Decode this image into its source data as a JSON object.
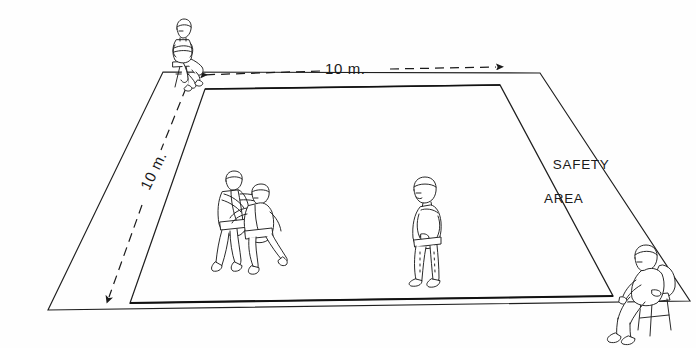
{
  "figure": {
    "type": "technical-line-drawing",
    "background_color": "#ffffff",
    "line_color": "#1a1a1a"
  },
  "labels": {
    "dimension_horizontal": "10 m.",
    "dimension_vertical": "10 m.",
    "safety_area_line1": "SAFETY",
    "safety_area_line2": "AREA"
  },
  "areas": [
    {
      "name": "contest-area",
      "label": "contest area",
      "size": "10 m. x 10 m."
    },
    {
      "name": "safety-area",
      "label": "SAFETY AREA"
    }
  ],
  "dimensions": [
    {
      "name": "width",
      "value": "10 m.",
      "orientation": "horizontal",
      "arrows": "both"
    },
    {
      "name": "depth",
      "value": "10 m.",
      "orientation": "diagonal-left",
      "arrows": "both"
    }
  ],
  "figures": [
    {
      "name": "judge-seated-top-left",
      "role": "judge",
      "pose": "seated on stool, arms folded"
    },
    {
      "name": "judoka-pair",
      "role": "contestants",
      "pose": "two judoka gripping in tachi-waza"
    },
    {
      "name": "referee-standing",
      "role": "referee",
      "pose": "standing, hands behind back"
    },
    {
      "name": "judge-seated-bottom-right",
      "role": "judge",
      "pose": "seated on chair"
    }
  ]
}
